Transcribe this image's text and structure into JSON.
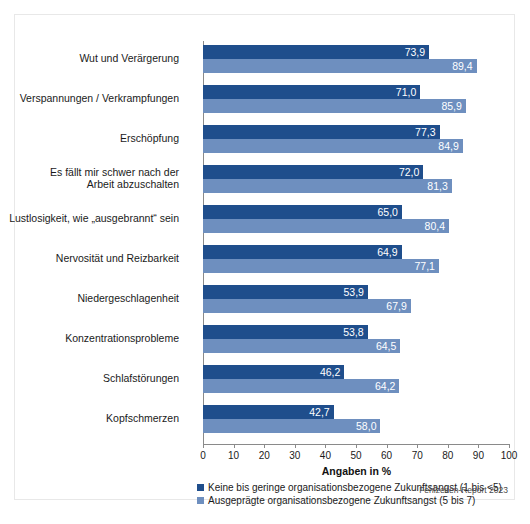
{
  "chart_data": {
    "type": "bar",
    "orientation": "horizontal",
    "title": "",
    "xlabel": "Angaben in %",
    "ylabel": "",
    "xlim": [
      0,
      100
    ],
    "xticks": [
      "0",
      "10",
      "20",
      "30",
      "40",
      "50",
      "60",
      "70",
      "80",
      "90",
      "100"
    ],
    "grid": false,
    "legend_position": "bottom-left",
    "categories": [
      "Wut und Verärgerung",
      "Verspannungen / Verkrampfungen",
      "Erschöpfung",
      "Es fällt mir schwer nach der\nArbeit abzuschalten",
      "Lustlosigkeit, wie „ausgebrannt“ sein",
      "Nervosität und Reizbarkeit",
      "Niedergeschlagenheit",
      "Konzentrationsprobleme",
      "Schlafstörungen",
      "Kopfschmerzen"
    ],
    "series": [
      {
        "name": "Keine bis geringe organisationsbezogene Zukunftsangst (1 bis <5)",
        "color": "#1F4E8C",
        "values": [
          73.9,
          71.0,
          77.3,
          72.0,
          65.0,
          64.9,
          53.9,
          53.8,
          46.2,
          42.7
        ],
        "labels": [
          "73,9",
          "71,0",
          "77,3",
          "72,0",
          "65,0",
          "64,9",
          "53,9",
          "53,8",
          "46,2",
          "42,7"
        ]
      },
      {
        "name": "Ausgeprägte organisationsbezogene Zukunftsangst (5 bis 7)",
        "color": "#6E8FBF",
        "values": [
          89.4,
          85.9,
          84.9,
          81.3,
          80.4,
          77.1,
          67.9,
          64.5,
          64.2,
          58.0
        ],
        "labels": [
          "89,4",
          "85,9",
          "84,9",
          "81,3",
          "80,4",
          "77,1",
          "67,9",
          "64,5",
          "64,2",
          "58,0"
        ]
      }
    ]
  },
  "legend": {
    "entries": [
      {
        "label": "Keine bis geringe organisationsbezogene Zukunftsangst (1 bis <5)"
      },
      {
        "label": "Ausgeprägte organisationsbezogene Zukunftsangst (5 bis 7)"
      }
    ]
  },
  "axis": {
    "title": "Angaben in %"
  },
  "source": {
    "text": "Fehlzeiten-Report 2023"
  },
  "colors": {
    "series_dark": "#1F4E8C",
    "series_light": "#6E8FBF",
    "axis": "#8a8a8a",
    "frame": "#e8e8e8",
    "text": "#1a1a1a"
  }
}
